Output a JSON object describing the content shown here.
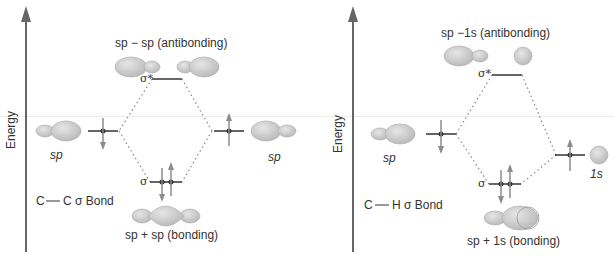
{
  "colors": {
    "axis": "#666666",
    "orbital_fill": "#cfcfcf",
    "orbital_stroke": "#a8a8a8",
    "level": "#333333",
    "electron": "#8c8c8c",
    "dotted": "#888888",
    "text": "#333333"
  },
  "left_diagram": {
    "axis_label": "Energy",
    "antibonding_label": "sp − sp (antibonding)",
    "antibonding_symbol": "σ*",
    "bonding_symbol": "σ",
    "bonding_label": "sp + sp (bonding)",
    "left_orbital_label": "sp",
    "right_orbital_label": "sp",
    "bond_label_a": "C",
    "bond_label_b": "C σ Bond"
  },
  "right_diagram": {
    "axis_label": "Energy",
    "antibonding_label": "sp −1s (antibonding)",
    "antibonding_symbol": "σ*",
    "bonding_symbol": "σ",
    "bonding_label": "sp  +  1s (bonding)",
    "left_orbital_label": "sp",
    "right_orbital_label": "1s",
    "bond_label_a": "C",
    "bond_label_b": "H σ Bond"
  }
}
